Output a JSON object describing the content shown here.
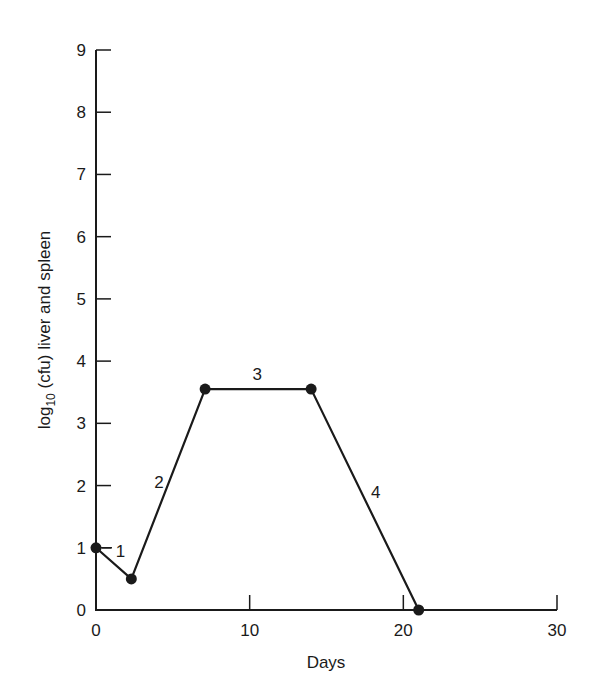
{
  "chart_data": {
    "type": "line",
    "title": "",
    "xlabel": "Days",
    "ylabel": "log10 (cfu) liver and spleen",
    "ylabel_parts": {
      "prefix": "log",
      "subscript": "10",
      "suffix": " (cfu) liver and spleen"
    },
    "xlim": [
      0,
      30
    ],
    "ylim": [
      0,
      9
    ],
    "xticks": [
      0,
      10,
      20,
      30
    ],
    "yticks": [
      0,
      1,
      2,
      3,
      4,
      5,
      6,
      7,
      8,
      9
    ],
    "grid": false,
    "legend": null,
    "series": [
      {
        "name": "infection course",
        "x": [
          0,
          2.3,
          7.1,
          14.0,
          21.0
        ],
        "y": [
          1.0,
          0.5,
          3.55,
          3.55,
          0.0
        ],
        "marker": "filled-circle",
        "color": "#1a1a1a"
      }
    ],
    "annotations": [
      {
        "text": "1",
        "x": 1.6,
        "y": 0.95,
        "describes": "segment 1 (initial decline)"
      },
      {
        "text": "2",
        "x": 4.1,
        "y": 2.05,
        "describes": "segment 2 (rise)"
      },
      {
        "text": "3",
        "x": 10.5,
        "y": 3.8,
        "describes": "segment 3 (plateau)"
      },
      {
        "text": "4",
        "x": 18.2,
        "y": 1.9,
        "describes": "segment 4 (decline)"
      }
    ]
  },
  "colors": {
    "ink": "#1a1a1a",
    "background": "#ffffff"
  }
}
